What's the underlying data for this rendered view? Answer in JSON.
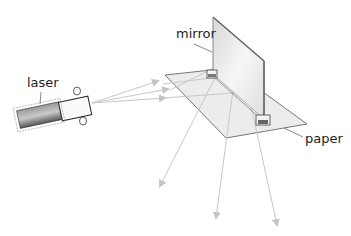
{
  "diagram": {
    "labels": {
      "laser": "laser",
      "mirror": "mirror",
      "paper": "paper"
    },
    "colors": {
      "ray": "#c8c8c8",
      "paper_fill": "#ececec",
      "paper_edge": "#555555",
      "mirror_fill": "#e4e4e4",
      "mirror_edge": "#777777",
      "laser_body": "#777777",
      "text": "#222222"
    }
  }
}
